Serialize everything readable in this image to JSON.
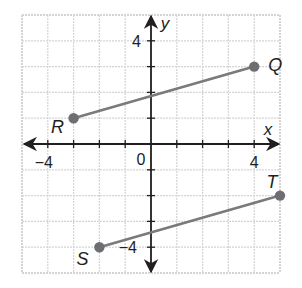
{
  "chart_data": {
    "type": "scatter",
    "title": "",
    "xlabel": "x",
    "ylabel": "y",
    "xlim": [
      -5,
      5
    ],
    "ylim": [
      -5,
      5
    ],
    "grid": true,
    "tick_labels": {
      "x": [
        {
          "value": -4,
          "label": "−4"
        },
        {
          "value": 0,
          "label": "0"
        },
        {
          "value": 4,
          "label": "4"
        }
      ],
      "y": [
        {
          "value": 4,
          "label": "4"
        },
        {
          "value": -4,
          "label": "−4"
        }
      ]
    },
    "points": [
      {
        "name": "R",
        "x": -3,
        "y": 1
      },
      {
        "name": "Q",
        "x": 4,
        "y": 3
      },
      {
        "name": "S",
        "x": -2,
        "y": -4
      },
      {
        "name": "T",
        "x": 5,
        "y": -2
      }
    ],
    "segments": [
      {
        "name": "RQ",
        "from": "R",
        "to": "Q"
      },
      {
        "name": "ST",
        "from": "S",
        "to": "T"
      }
    ]
  },
  "colors": {
    "grid": "#d4d4d4",
    "axis": "#231f20",
    "segment": "#7a7a7a",
    "point": "#6d6e71"
  }
}
